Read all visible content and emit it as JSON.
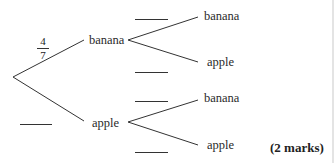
{
  "tree": {
    "first": {
      "banana_label": "banana",
      "apple_label": "apple",
      "banana_probability": {
        "numerator": "4",
        "denominator": "7"
      },
      "apple_probability": ""
    },
    "second_after_banana": {
      "banana_label": "banana",
      "apple_label": "apple",
      "banana_probability": "",
      "apple_probability": ""
    },
    "second_after_apple": {
      "banana_label": "banana",
      "apple_label": "apple",
      "banana_probability": "",
      "apple_probability": ""
    }
  },
  "marks": "(2 marks)"
}
